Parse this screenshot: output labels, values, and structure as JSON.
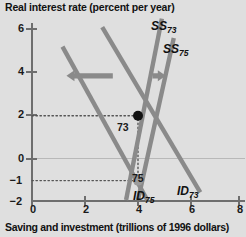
{
  "chart_data": {
    "type": "line",
    "title": "",
    "ylabel": "Real interest rate (percent per year)",
    "xlabel": "Saving and investment (trillions of 1996 dollars)",
    "xlim": [
      0,
      8.6
    ],
    "ylim": [
      -2,
      6.6
    ],
    "grid": false,
    "legend_position": "inline-curve-labels",
    "yticks": [
      {
        "value": 6,
        "label": "6"
      },
      {
        "value": 4,
        "label": "4"
      },
      {
        "value": 2,
        "label": "2"
      },
      {
        "value": 0,
        "label": "0"
      },
      {
        "value": -1,
        "label": "−1"
      },
      {
        "value": -2,
        "label": "−2"
      }
    ],
    "xticks": [
      {
        "value": 0,
        "label": "0"
      },
      {
        "value": 2,
        "label": "2"
      },
      {
        "value": 4,
        "label": "4"
      },
      {
        "value": 6,
        "label": "6"
      },
      {
        "value": 8,
        "label": "8"
      }
    ],
    "series": [
      {
        "name": "SS73",
        "label": "SS",
        "sublabel": "73",
        "kind": "supply",
        "color": "#8a8a8a",
        "points": [
          [
            3.55,
            -1.9
          ],
          [
            4.9,
            6.5
          ]
        ]
      },
      {
        "name": "SS75",
        "label": "SS",
        "sublabel": "75",
        "kind": "supply",
        "color": "#8a8a8a",
        "points": [
          [
            4.0,
            -1.9
          ],
          [
            5.35,
            5.6
          ]
        ]
      },
      {
        "name": "ID75",
        "label": "ID",
        "sublabel": "75",
        "kind": "demand",
        "color": "#8a8a8a",
        "points": [
          [
            1.15,
            5.2
          ],
          [
            4.35,
            -1.9
          ]
        ]
      },
      {
        "name": "ID73",
        "label": "ID",
        "sublabel": "73",
        "kind": "demand",
        "color": "#8a8a8a",
        "points": [
          [
            2.65,
            6.1
          ],
          [
            6.35,
            -1.55
          ]
        ]
      }
    ],
    "equilibria": [
      {
        "name": "73",
        "label": "73",
        "x": 4.0,
        "y": 2.0,
        "marker": "filled-circle",
        "color": "#111111"
      },
      {
        "name": "75",
        "label": "75",
        "x": 4.0,
        "y": -1.0,
        "marker": "filled-circle",
        "color": "#9a9a9a"
      }
    ],
    "annotations": [
      {
        "name": "id-shift-arrow",
        "text": "",
        "direction": "left",
        "from_x": 3.05,
        "to_x": 1.3,
        "y": 3.85
      },
      {
        "name": "ss-shift-arrow",
        "text": "",
        "direction": "right",
        "from_x": 4.55,
        "to_x": 5.05,
        "y": 3.85
      }
    ],
    "guide_lines": [
      {
        "name": "interest-rate-73-guide",
        "orientation": "horizontal",
        "value": 2,
        "from": 0,
        "to": 4,
        "style": "dotted"
      },
      {
        "name": "interest-rate-75-guide",
        "orientation": "horizontal",
        "value": -1,
        "from": 0,
        "to": 4,
        "style": "dotted"
      },
      {
        "name": "quantity-guide",
        "orientation": "vertical",
        "value": 4,
        "from": -1,
        "to": 2,
        "style": "dotted"
      }
    ],
    "colors": {
      "background": "#dfdfdf",
      "curve": "#8a8a8a",
      "axis": "#6e6e6e",
      "text": "#111111",
      "zero_line": "#b8b8b8",
      "arrow": "#8a8a8a"
    }
  }
}
